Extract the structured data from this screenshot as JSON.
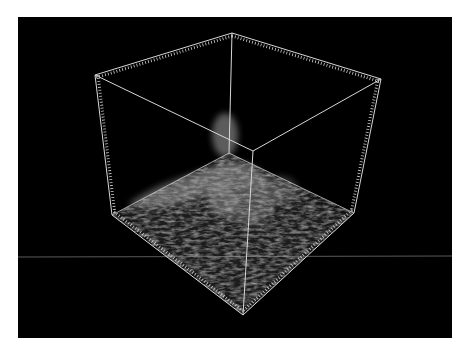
{
  "figure": {
    "caption": "3D volume rendering inside a bounding box with tick-marked edges",
    "background": "#000000",
    "page_background": "#ffffff",
    "box_color": "#d8d8d8",
    "volume_color": "#9a9a9a",
    "reference_line_color": "#5a5a5a",
    "vertices": {
      "top_back": [
        232,
        33
      ],
      "top_left": [
        95,
        75
      ],
      "top_right": [
        381,
        79
      ],
      "top_front": [
        253,
        151
      ],
      "bottom_back": [
        229,
        153
      ],
      "bottom_left": [
        112,
        215
      ],
      "bottom_right": [
        354,
        213
      ],
      "bottom_front": [
        243,
        315
      ]
    },
    "horizontal_reference_line_y": 257
  }
}
